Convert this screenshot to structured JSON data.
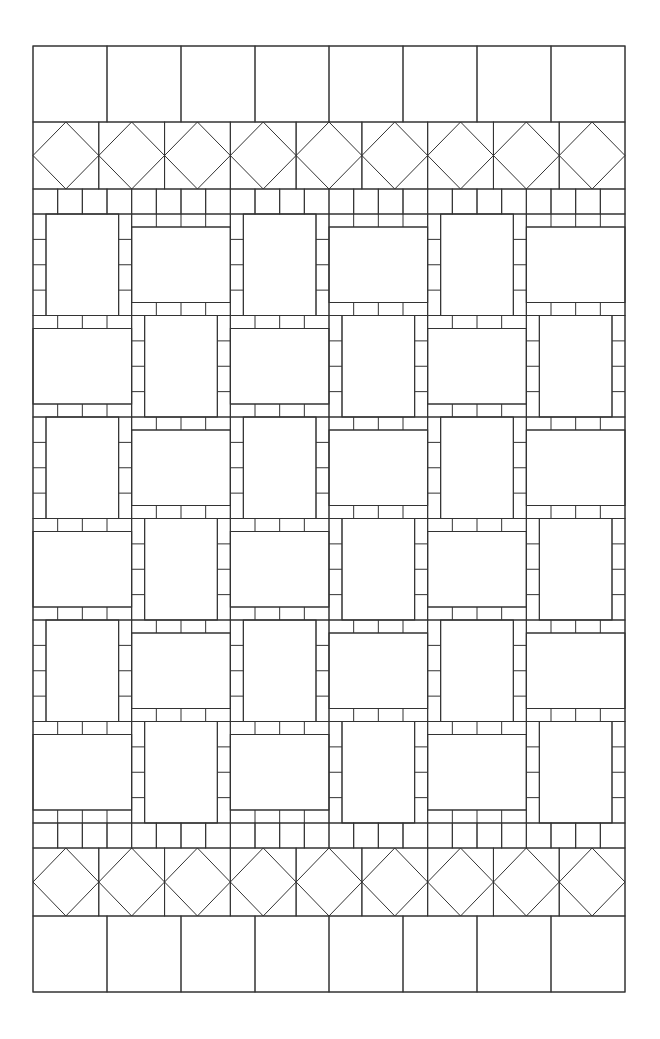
{
  "diagram": {
    "title": "Quilt layout pattern",
    "line_color": "#333333",
    "background": "#ffffff",
    "outer": {
      "x": 33,
      "y": 46,
      "width": 592,
      "height": 946
    },
    "bands": [
      {
        "name": "top-square-border",
        "type": "squares",
        "y": 46,
        "height": 76,
        "count": 8
      },
      {
        "name": "top-diamond-border",
        "type": "diamonds",
        "y": 122,
        "height": 67,
        "count": 9
      },
      {
        "name": "top-strip-border",
        "type": "strip",
        "y": 189,
        "height": 25,
        "count": 24
      },
      {
        "name": "center-blocks",
        "type": "blocks",
        "y": 214,
        "height": 609,
        "rows": 6,
        "cols": 6,
        "first_block": "vertical-sashing",
        "sash_width": 13,
        "sash_segments": 4
      },
      {
        "name": "bottom-strip-border",
        "type": "strip",
        "y": 823,
        "height": 25,
        "count": 24
      },
      {
        "name": "bottom-diamond-border",
        "type": "diamonds",
        "y": 848,
        "height": 68,
        "count": 9
      },
      {
        "name": "bottom-square-border",
        "type": "squares",
        "y": 916,
        "height": 76,
        "count": 8
      }
    ]
  }
}
